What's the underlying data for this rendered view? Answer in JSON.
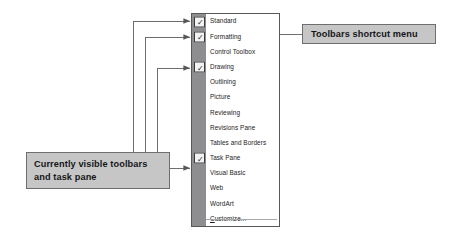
{
  "menu": {
    "name": "Toolbars shortcut menu",
    "items": [
      {
        "label": "Standard",
        "checked": true,
        "separator_above": false
      },
      {
        "label": "Formatting",
        "checked": true,
        "separator_above": false
      },
      {
        "label": "Control Toolbox",
        "checked": false,
        "separator_above": false
      },
      {
        "label": "Drawing",
        "checked": true,
        "separator_above": false
      },
      {
        "label": "Outlining",
        "checked": false,
        "separator_above": false
      },
      {
        "label": "Picture",
        "checked": false,
        "separator_above": false
      },
      {
        "label": "Reviewing",
        "checked": false,
        "separator_above": false
      },
      {
        "label": "Revisions Pane",
        "checked": false,
        "separator_above": false
      },
      {
        "label": "Tables and Borders",
        "checked": false,
        "separator_above": false
      },
      {
        "label": "Task Pane",
        "checked": true,
        "separator_above": false
      },
      {
        "label": "Visual Basic",
        "checked": false,
        "separator_above": false
      },
      {
        "label": "Web",
        "checked": false,
        "separator_above": false
      },
      {
        "label": "WordArt",
        "checked": false,
        "separator_above": false
      },
      {
        "label": "Customize...",
        "checked": false,
        "separator_above": true,
        "accelerator": "C"
      }
    ],
    "check_glyph": "✓"
  },
  "callouts": {
    "visible_toolbars": {
      "line1": "Currently visible toolbars",
      "line2": "and task pane"
    },
    "shortcut_menu": {
      "text": "Toolbars shortcut menu"
    }
  },
  "colors": {
    "callout_fill": "#c6c6c6",
    "callout_border": "#6e6e70",
    "menu_gutter": "#8e8e90",
    "menu_border": "#58585a",
    "menu_background": "#ffffff",
    "text": "#16161a",
    "leader_line": "#6e6e70"
  }
}
